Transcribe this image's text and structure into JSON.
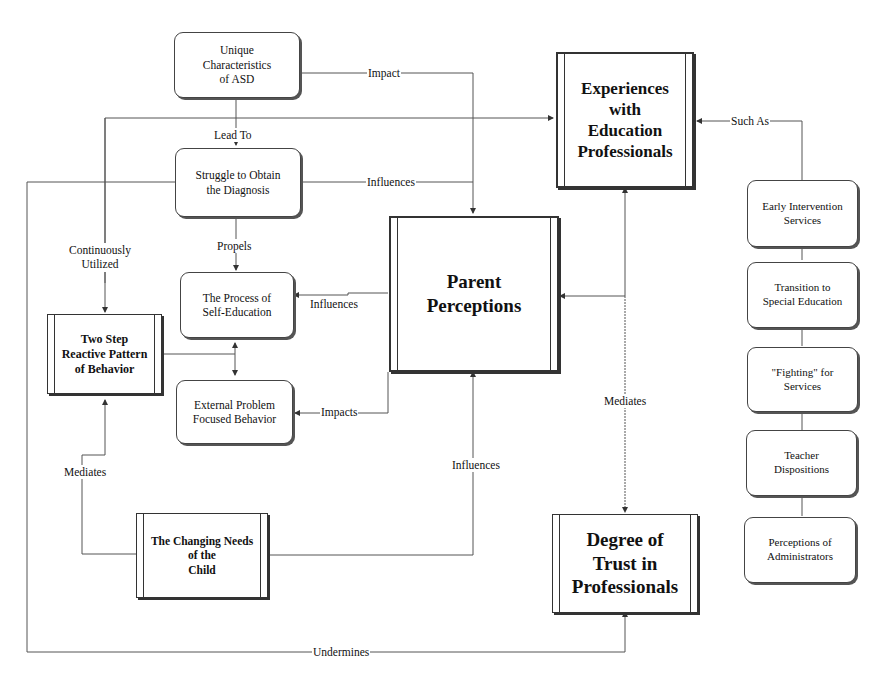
{
  "diagram": {
    "nodes": {
      "unique_characteristics": "Unique\nCharacteristics\nof ASD",
      "struggle_diagnosis": "Struggle to Obtain\nthe Diagnosis",
      "process_self_education": "The Process of\nSelf-Education",
      "external_problem": "External Problem\nFocused Behavior",
      "two_step": "Two Step\nReactive Pattern\nof Behavior",
      "changing_needs": "The Changing Needs\nof the\nChild",
      "parent_perceptions": "Parent\nPerceptions",
      "experiences_education": "Experiences\nwith\nEducation\nProfessionals",
      "degree_of_trust": "Degree of\nTrust in\nProfessionals",
      "early_intervention": "Early Intervention\nServices",
      "transition_special_ed": "Transition to\nSpecial Education",
      "fighting_services": "\"Fighting\" for\nServices",
      "teacher_dispositions": "Teacher\nDispositions",
      "perceptions_admin": "Perceptions of\nAdministrators"
    },
    "edge_labels": {
      "impact": "Impact",
      "lead_to": "Lead To",
      "influences_struggle": "Influences",
      "propels": "Propels",
      "continuously_utilized": "Continuously\nUtilized",
      "influences_self_ed": "Influences",
      "impacts_external": "Impacts",
      "mediates_left": "Mediates",
      "influences_changing": "Influences",
      "mediates_right": "Mediates",
      "such_as": "Such As",
      "undermines": "Undermines"
    }
  }
}
